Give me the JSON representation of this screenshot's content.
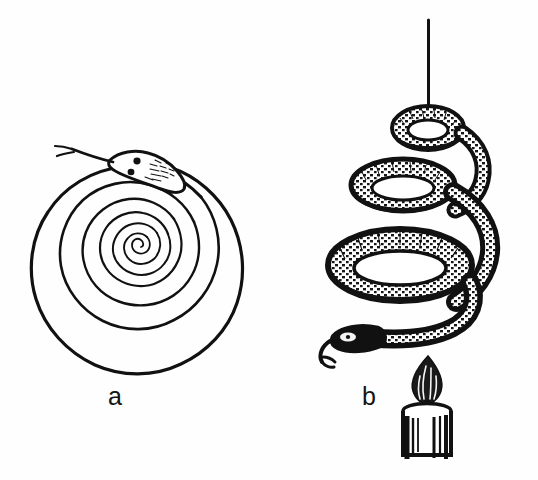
{
  "figure": {
    "background_color": "#fefefe",
    "ink_color": "#111111",
    "width": 538,
    "height": 480
  },
  "panels": [
    {
      "id": "a",
      "label": "a",
      "caption_label": "a",
      "description": "Flat paper snake cut as an Archimedean spiral, head with forked tongue at the top outer end",
      "elements": {
        "spiral_name": "paper-spiral-snake",
        "turns": 4.6,
        "outer_radius_px": 100,
        "center_x_px": 145,
        "center_y_px": 270,
        "head_label": "snake-head",
        "tongue_label": "forked-tongue",
        "eye_count": 2
      }
    },
    {
      "id": "b",
      "label": "b",
      "caption_label": "b",
      "description": "Spiral snake suspended by a thread, hanging in loose coils above a lit candle",
      "elements": {
        "thread_label": "suspension-thread",
        "thread_top_y_px": 20,
        "coil_count": 3,
        "snake_label": "hanging-coiled-snake",
        "head_label": "snake-head",
        "tongue_label": "forked-tongue",
        "candle_label": "lit-candle",
        "flame_label": "candle-flame",
        "candle_body_label": "candle-body",
        "wick_label": "candle-wick"
      }
    }
  ],
  "colors": {
    "ink": "#111111",
    "ink_soft": "#2b2b2b",
    "paper": "#fefefe",
    "shade": "#3a3a3a"
  }
}
